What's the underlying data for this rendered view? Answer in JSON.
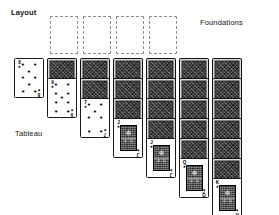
{
  "diagram": {
    "title": "Layout",
    "labels": {
      "layout": "Layout",
      "foundations": "Foundations",
      "tableau": "Tableau"
    },
    "colors": {
      "background": "#ffffff",
      "text": "#141414",
      "card_back": "#3a3a3a",
      "card_face": "#ffffff",
      "card_border": "#1a1a1a",
      "foundation_outline": "#8d8d8d"
    }
  },
  "foundations": {
    "count": 4,
    "state": "empty",
    "slots": [
      {
        "index": 1,
        "rank": "",
        "suit": "",
        "empty": true
      },
      {
        "index": 2,
        "rank": "",
        "suit": "",
        "empty": true
      },
      {
        "index": 3,
        "rank": "",
        "suit": "",
        "empty": true
      },
      {
        "index": 4,
        "rank": "",
        "suit": "",
        "empty": true
      }
    ]
  },
  "tableau": {
    "column_count": 7,
    "columns": [
      {
        "index": 1,
        "face_down": 0,
        "face_up": [
          {
            "rank": "8",
            "suit": "♠",
            "type": "number",
            "pips": 8
          }
        ]
      },
      {
        "index": 2,
        "face_down": 1,
        "face_up": [
          {
            "rank": "9",
            "suit": "♠",
            "type": "number",
            "pips": 9
          }
        ]
      },
      {
        "index": 3,
        "face_down": 2,
        "face_up": [
          {
            "rank": "7",
            "suit": "♠",
            "type": "number",
            "pips": 7
          }
        ]
      },
      {
        "index": 4,
        "face_down": 3,
        "face_up": [
          {
            "rank": "J",
            "suit": "♠",
            "type": "court"
          }
        ]
      },
      {
        "index": 5,
        "face_down": 4,
        "face_up": [
          {
            "rank": "J",
            "suit": "♠",
            "type": "court"
          }
        ]
      },
      {
        "index": 6,
        "face_down": 5,
        "face_up": [
          {
            "rank": "Q",
            "suit": "♠",
            "type": "court"
          }
        ]
      },
      {
        "index": 7,
        "face_down": 6,
        "face_up": [
          {
            "rank": "K",
            "suit": "♠",
            "type": "court"
          }
        ]
      }
    ]
  }
}
